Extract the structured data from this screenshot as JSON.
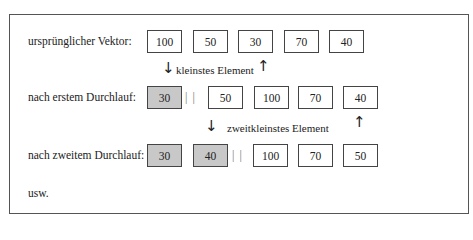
{
  "rows": [
    {
      "label": "ursprünglicher Vektor:",
      "values": [
        "100",
        "50",
        "30",
        "70",
        "40"
      ],
      "sorted_count": 0
    },
    {
      "label": "nach erstem Durchlauf:",
      "values": [
        "30",
        "50",
        "100",
        "70",
        "40"
      ],
      "sorted_count": 1
    },
    {
      "label": "nach zweitem Durchlauf:",
      "values": [
        "30",
        "40",
        "100",
        "70",
        "50"
      ],
      "sorted_count": 2
    }
  ],
  "annotations": {
    "first": "kleinstes Element",
    "second": "zweitkleinstes Element"
  },
  "separator": "| |",
  "footer": "usw.",
  "arrows": {
    "down": "↓",
    "up": "↑"
  },
  "colors": {
    "sorted_fill": "#c8c8c8",
    "border": "#444444"
  }
}
